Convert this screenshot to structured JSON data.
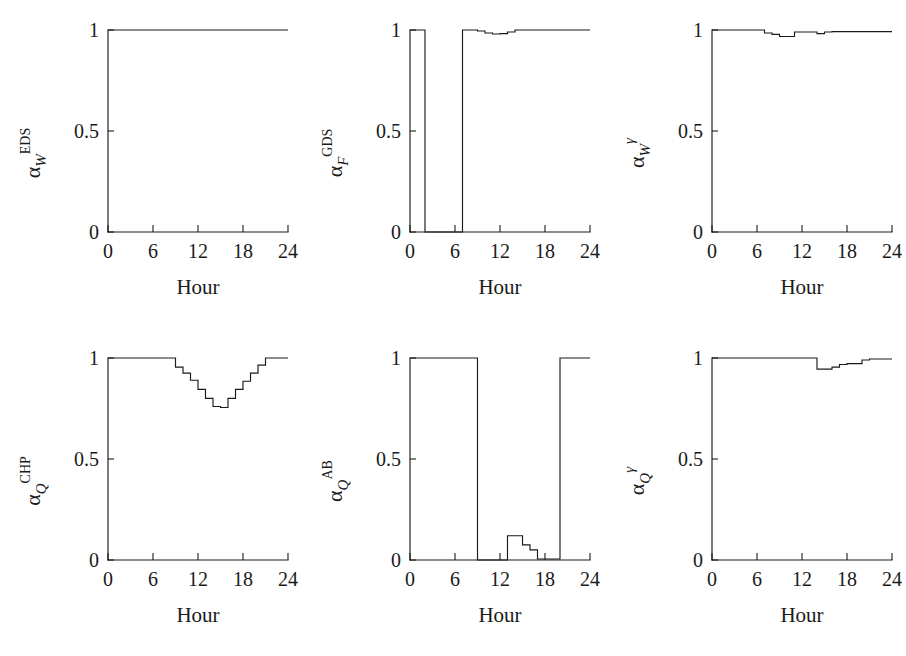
{
  "figure": {
    "panel_count": 6,
    "xlabel": "Hour",
    "x_ticks": [
      "0",
      "6",
      "12",
      "18",
      "24"
    ],
    "y_ticks": [
      "0",
      "0.5",
      "1"
    ],
    "line_color": "#1a1a1a",
    "background": "#ffffff"
  },
  "chart_data": [
    {
      "type": "line",
      "id": "alpha-w-eds",
      "title": "",
      "ylabel": "α_W^EDS",
      "ylabel_parts": {
        "base": "α",
        "sub": "W",
        "sup": "EDS"
      },
      "xlabel": "Hour",
      "xlim": [
        0,
        24
      ],
      "ylim": [
        0,
        1
      ],
      "xticks": [
        0,
        6,
        12,
        18,
        24
      ],
      "yticks": [
        0,
        0.5,
        1
      ],
      "grid": false,
      "legend": "none",
      "step": "post",
      "x": [
        0,
        1,
        2,
        3,
        4,
        5,
        6,
        7,
        8,
        9,
        10,
        11,
        12,
        13,
        14,
        15,
        16,
        17,
        18,
        19,
        20,
        21,
        22,
        23,
        24
      ],
      "y": [
        1,
        1,
        1,
        1,
        1,
        1,
        1,
        1,
        1,
        1,
        1,
        1,
        1,
        1,
        1,
        1,
        1,
        1,
        1,
        1,
        1,
        1,
        1,
        1,
        1
      ]
    },
    {
      "type": "line",
      "id": "alpha-f-gds",
      "title": "",
      "ylabel": "α_F^GDS",
      "ylabel_parts": {
        "base": "α",
        "sub": "F",
        "sup": "GDS"
      },
      "xlabel": "Hour",
      "xlim": [
        0,
        24
      ],
      "ylim": [
        0,
        1
      ],
      "xticks": [
        0,
        6,
        12,
        18,
        24
      ],
      "yticks": [
        0,
        0.5,
        1
      ],
      "grid": false,
      "legend": "none",
      "step": "post",
      "x": [
        0,
        1,
        2,
        3,
        4,
        5,
        6,
        7,
        8,
        9,
        10,
        11,
        12,
        13,
        14,
        15,
        16,
        17,
        18,
        19,
        20,
        21,
        22,
        23,
        24
      ],
      "y": [
        1,
        1,
        0,
        0,
        0,
        0,
        0,
        1,
        1,
        0.995,
        0.985,
        0.98,
        0.982,
        0.99,
        1,
        1,
        1,
        1,
        1,
        1,
        1,
        1,
        1,
        1,
        1
      ]
    },
    {
      "type": "line",
      "id": "alpha-w-gamma",
      "title": "",
      "ylabel": "α_W^γ",
      "ylabel_parts": {
        "base": "α",
        "sub": "W",
        "sup": "γ"
      },
      "xlabel": "Hour",
      "xlim": [
        0,
        24
      ],
      "ylim": [
        0,
        1
      ],
      "xticks": [
        0,
        6,
        12,
        18,
        24
      ],
      "yticks": [
        0,
        0.5,
        1
      ],
      "grid": false,
      "legend": "none",
      "step": "post",
      "x": [
        0,
        1,
        2,
        3,
        4,
        5,
        6,
        7,
        8,
        9,
        10,
        11,
        12,
        13,
        14,
        15,
        16,
        17,
        18,
        19,
        20,
        21,
        22,
        23,
        24
      ],
      "y": [
        1,
        1,
        1,
        1,
        1,
        1,
        1,
        0.985,
        0.978,
        0.968,
        0.968,
        0.99,
        0.99,
        0.99,
        0.982,
        0.99,
        0.992,
        0.992,
        0.992,
        0.992,
        0.992,
        0.992,
        0.992,
        0.992,
        0.992
      ]
    },
    {
      "type": "line",
      "id": "alpha-q-chp",
      "title": "",
      "ylabel": "α_Q^CHP",
      "ylabel_parts": {
        "base": "α",
        "sub": "Q",
        "sup": "CHP"
      },
      "xlabel": "Hour",
      "xlim": [
        0,
        24
      ],
      "ylim": [
        0,
        1
      ],
      "xticks": [
        0,
        6,
        12,
        18,
        24
      ],
      "yticks": [
        0,
        0.5,
        1
      ],
      "grid": false,
      "legend": "none",
      "step": "post",
      "x": [
        0,
        1,
        2,
        3,
        4,
        5,
        6,
        7,
        8,
        9,
        10,
        11,
        12,
        13,
        14,
        15,
        16,
        17,
        18,
        19,
        20,
        21,
        22,
        23,
        24
      ],
      "y": [
        1,
        1,
        1,
        1,
        1,
        1,
        1,
        1,
        1,
        0.955,
        0.925,
        0.89,
        0.845,
        0.8,
        0.76,
        0.755,
        0.8,
        0.845,
        0.885,
        0.925,
        0.965,
        1,
        1,
        1,
        1
      ]
    },
    {
      "type": "line",
      "id": "alpha-q-ab",
      "title": "",
      "ylabel": "α_Q^AB",
      "ylabel_parts": {
        "base": "α",
        "sub": "Q",
        "sup": "AB"
      },
      "xlabel": "Hour",
      "xlim": [
        0,
        24
      ],
      "ylim": [
        0,
        1
      ],
      "xticks": [
        0,
        6,
        12,
        18,
        24
      ],
      "yticks": [
        0,
        0.5,
        1
      ],
      "grid": false,
      "legend": "none",
      "step": "post",
      "x": [
        0,
        1,
        2,
        3,
        4,
        5,
        6,
        7,
        8,
        9,
        10,
        11,
        12,
        13,
        14,
        15,
        16,
        17,
        18,
        19,
        20,
        21,
        22,
        23,
        24
      ],
      "y": [
        1,
        1,
        1,
        1,
        1,
        1,
        1,
        1,
        1,
        0,
        0,
        0,
        0,
        0.12,
        0.12,
        0.075,
        0.05,
        0.005,
        0.005,
        0.005,
        1,
        1,
        1,
        1,
        1
      ]
    },
    {
      "type": "line",
      "id": "alpha-q-gamma",
      "title": "",
      "ylabel": "α_Q^γ",
      "ylabel_parts": {
        "base": "α",
        "sub": "Q",
        "sup": "γ"
      },
      "xlabel": "Hour",
      "xlim": [
        0,
        24
      ],
      "ylim": [
        0,
        1
      ],
      "xticks": [
        0,
        6,
        12,
        18,
        24
      ],
      "yticks": [
        0,
        0.5,
        1
      ],
      "grid": false,
      "legend": "none",
      "step": "post",
      "x": [
        0,
        1,
        2,
        3,
        4,
        5,
        6,
        7,
        8,
        9,
        10,
        11,
        12,
        13,
        14,
        15,
        16,
        17,
        18,
        19,
        20,
        21,
        22,
        23,
        24
      ],
      "y": [
        1,
        1,
        1,
        1,
        1,
        1,
        1,
        1,
        1,
        1,
        1,
        1,
        1,
        1,
        0.945,
        0.945,
        0.955,
        0.968,
        0.972,
        0.972,
        0.99,
        0.995,
        0.995,
        0.995,
        0.995
      ]
    }
  ]
}
